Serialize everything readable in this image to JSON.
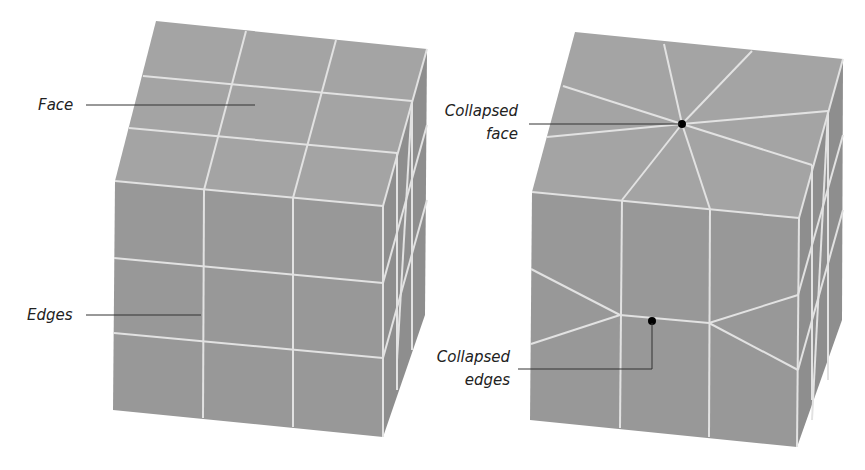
{
  "figure": {
    "colors": {
      "background": "#ffffff",
      "top_face": "#a4a4a4",
      "front_face": "#999999",
      "side_face": "#8f8f8f",
      "edge_lines": "#e2e2e2",
      "leader_lines": "#333333",
      "label_text": "#222222",
      "marker_dot": "#000000"
    }
  },
  "left_cube": {
    "labels": {
      "face": "Face",
      "edges": "Edges"
    }
  },
  "right_cube": {
    "labels": {
      "collapsed_face_line1": "Collapsed",
      "collapsed_face_line2": "face",
      "collapsed_edges_line1": "Collapsed",
      "collapsed_edges_line2": "edges"
    }
  }
}
